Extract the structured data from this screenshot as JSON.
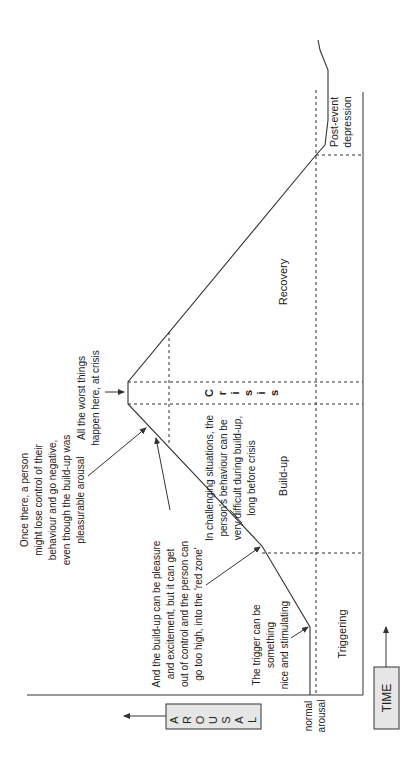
{
  "diagram": {
    "axes": {
      "y_label": "AROUSAL",
      "y_label_letters": [
        "A",
        "R",
        "O",
        "U",
        "S",
        "A",
        "L"
      ],
      "x_label": "TIME",
      "baseline_label_line1": "normal",
      "baseline_label_line2": "arousal"
    },
    "phases": {
      "triggering": "Triggering",
      "buildup": "Build-up",
      "crisis": "Crisis",
      "crisis_letters": [
        "C",
        "r",
        "i",
        "s",
        "i",
        "s"
      ],
      "recovery": "Recovery",
      "post_event_line1": "Post-event",
      "post_event_line2": "depression"
    },
    "annotations": {
      "trigger": [
        "The trigger can be",
        "something",
        "nice and stimulating"
      ],
      "pleasure": [
        "And the build-up can be pleasure",
        "and excitement, but it can get",
        "out of control and the person can",
        "go too high, into the 'red zone'"
      ],
      "challenging": [
        "In challenging situations, the",
        "person's behaviour can be",
        "very difficult during build-up,",
        "long before crisis"
      ],
      "once_there": [
        "Once there, a person",
        "might lose control of their",
        "behaviour and go negative,",
        "even though the build-up was",
        "pleasurable arousal"
      ],
      "worst": [
        "All the worst things",
        "happen here, at crisis"
      ]
    },
    "colors": {
      "line": "#333333",
      "label_box_fill": "#e6e6e6",
      "text": "#222222"
    }
  }
}
